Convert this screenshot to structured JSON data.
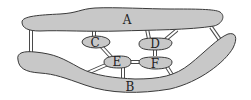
{
  "diagram": {
    "type": "islands-and-bridges",
    "islands": [
      {
        "id": "A",
        "label": "A"
      },
      {
        "id": "B",
        "label": "B"
      },
      {
        "id": "C",
        "label": "C"
      },
      {
        "id": "D",
        "label": "D"
      },
      {
        "id": "E",
        "label": "E"
      },
      {
        "id": "F",
        "label": "F"
      }
    ],
    "bridges": [
      {
        "from": "A",
        "to": "B",
        "position": "left"
      },
      {
        "from": "A",
        "to": "B",
        "position": "right"
      },
      {
        "from": "A",
        "to": "C"
      },
      {
        "from": "A",
        "to": "D",
        "position": "vertical"
      },
      {
        "from": "A",
        "to": "D",
        "position": "diagonal"
      },
      {
        "from": "C",
        "to": "E"
      },
      {
        "from": "E",
        "to": "B",
        "position": "diagonal-left"
      },
      {
        "from": "E",
        "to": "B",
        "position": "vertical"
      },
      {
        "from": "E",
        "to": "F"
      },
      {
        "from": "D",
        "to": "F"
      },
      {
        "from": "F",
        "to": "B"
      }
    ],
    "colors": {
      "island_fill": "#c8c8c8",
      "outline": "#3a3a3a",
      "background": "#ffffff"
    }
  }
}
